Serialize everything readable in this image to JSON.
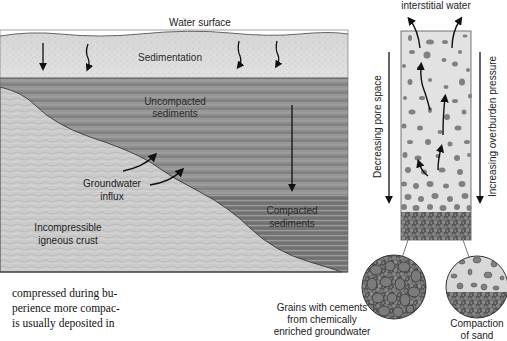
{
  "figure": {
    "cross_section": {
      "labels": {
        "water_surface": "Water surface",
        "sedimentation": "Sedimentation",
        "uncompacted_line1": "Uncompacted",
        "uncompacted_line2": "sediments",
        "groundwater_line1": "Groundwater",
        "groundwater_line2": "influx",
        "compacted_line1": "Compacted",
        "compacted_line2": "sediments",
        "crust_line1": "Incompressible",
        "crust_line2": "igneous crust"
      }
    },
    "column": {
      "top_label": "interstitial water",
      "left_axis_label": "Decreasing pore space",
      "right_axis_label": "Increasing overburden pressure"
    },
    "insets": {
      "left_caption_line1": "Grains with cements",
      "left_caption_line2": "from chemically",
      "left_caption_line3": "enriched groundwater",
      "right_caption_line1": "Compaction",
      "right_caption_line2": "of sand"
    }
  },
  "body_text": {
    "lines": [
      "compressed during bu-",
      "perience more compac-",
      "is usually deposited in"
    ]
  },
  "colors": {
    "sediment_light": "#d9d9d9",
    "sediment_band": "#8a8a8a",
    "crust": "#c9c9c9",
    "grain": "#7a7a7a",
    "outline": "#2b2b2b"
  }
}
